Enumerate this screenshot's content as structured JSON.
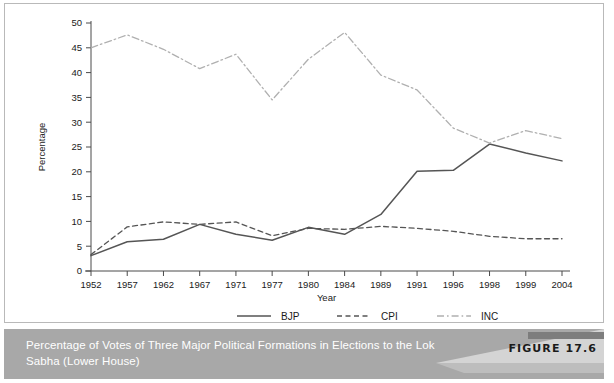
{
  "figure": {
    "tag": "FIGURE 17.6",
    "caption": "Percentage of Votes of Three Major Political Formations in Elections to the Lok Sabha (Lower House)"
  },
  "chart_data": {
    "type": "line",
    "title": "",
    "xlabel": "Year",
    "ylabel": "Percentage",
    "categories": [
      "1952",
      "1957",
      "1962",
      "1967",
      "1971",
      "1977",
      "1980",
      "1984",
      "1989",
      "1991",
      "1996",
      "1998",
      "1999",
      "2004"
    ],
    "ylim": [
      0,
      50
    ],
    "yticks": [
      "0",
      "5",
      "10",
      "15",
      "20",
      "25",
      "30",
      "35",
      "40",
      "45",
      "50"
    ],
    "grid": false,
    "legend_position": "bottom",
    "series": [
      {
        "name": "BJP",
        "style": "solid",
        "color": "#555555",
        "values": [
          3.1,
          5.9,
          6.4,
          9.4,
          7.4,
          6.2,
          8.8,
          7.4,
          11.4,
          20.1,
          20.3,
          25.6,
          23.8,
          22.2
        ]
      },
      {
        "name": "CPI",
        "style": "dashed",
        "color": "#555555",
        "values": [
          3.3,
          8.9,
          9.9,
          9.4,
          9.9,
          7.1,
          8.6,
          8.4,
          9.0,
          8.6,
          8.0,
          7.0,
          6.5,
          6.5
        ]
      },
      {
        "name": "INC",
        "style": "dashdot",
        "color": "#b0b0b0",
        "values": [
          45.0,
          47.6,
          44.7,
          40.8,
          43.7,
          34.5,
          42.7,
          48.1,
          39.5,
          36.5,
          28.8,
          25.8,
          28.3,
          26.7
        ]
      }
    ]
  },
  "axes": {
    "y_tick_values": [
      0,
      5,
      10,
      15,
      20,
      25,
      30,
      35,
      40,
      45,
      50
    ]
  }
}
